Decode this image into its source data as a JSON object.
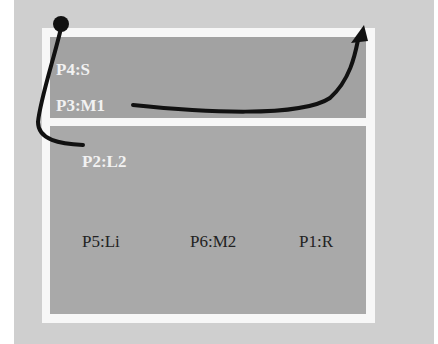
{
  "diagram": {
    "regions": [
      {
        "id": "top",
        "labels": [
          "P4:S",
          "P3:M1"
        ]
      },
      {
        "id": "bottom",
        "labels": [
          "P2:L2",
          "P5:Li",
          "P6:M2",
          "P1:R"
        ]
      }
    ],
    "labels": {
      "p4": "P4:S",
      "p3": "P3:M1",
      "p2": "P2:L2",
      "p5": "P5:Li",
      "p6": "P6:M2",
      "p1": "P1:R"
    },
    "path": {
      "start_marker": "filled-circle",
      "end_marker": "arrowhead",
      "sequence": [
        "start",
        "P4:S",
        "P3:M1 side",
        "P2:L2",
        "P3:M1",
        "exit top-right"
      ]
    },
    "colors": {
      "background": "#cfcfcf",
      "frame": "#f7f7f7",
      "panel_top": "#a2a2a2",
      "panel_bottom": "#a9a9a9",
      "path": "#111111",
      "light_text": "#f2f2f2",
      "dark_text": "#222222"
    }
  }
}
